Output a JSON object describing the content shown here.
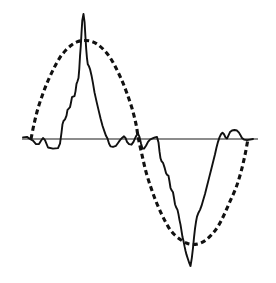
{
  "figure": {
    "background_color": "#ffffff",
    "width": 276,
    "height": 283
  },
  "chart_data": {
    "type": "line",
    "title": "",
    "subtitle": "",
    "xlabel": "",
    "ylabel": "",
    "grid": false,
    "legend_position": "none",
    "axis_visible": true,
    "xlim": [
      0,
      276
    ],
    "ylim": [
      -1.45,
      1.25
    ],
    "zero_axis": {
      "label": "zero-line",
      "y_value": 0,
      "x_start": 22,
      "x_end": 258,
      "y_pixel": 139,
      "color": "#1a1a1a",
      "width": 1.2
    },
    "series": [
      {
        "name": "reference-sine",
        "style": "dashed",
        "color": "#111111",
        "stroke_width": 3.1,
        "dash_pattern": "5,3.4",
        "description": "dashed sinusoidal reference, one full cycle",
        "cycle": {
          "zero_crossings_px": [
            31,
            138.5,
            248
          ],
          "positive_peak_px": {
            "x": 85,
            "y": 85
          },
          "negative_peak_px": {
            "x": 193,
            "y": 196
          },
          "amplitude_value": 0.93,
          "period_px": 217
        },
        "points": [
          [
            31,
            0.0
          ],
          [
            34,
            0.14
          ],
          [
            38,
            0.29
          ],
          [
            43,
            0.43
          ],
          [
            48,
            0.55
          ],
          [
            54,
            0.67
          ],
          [
            60,
            0.77
          ],
          [
            66,
            0.84
          ],
          [
            72,
            0.89
          ],
          [
            78,
            0.92
          ],
          [
            85,
            0.93
          ],
          [
            92,
            0.92
          ],
          [
            98,
            0.89
          ],
          [
            104,
            0.84
          ],
          [
            110,
            0.77
          ],
          [
            116,
            0.67
          ],
          [
            122,
            0.55
          ],
          [
            127,
            0.43
          ],
          [
            132,
            0.29
          ],
          [
            136,
            0.14
          ],
          [
            138.5,
            0.0
          ],
          [
            142,
            -0.14
          ],
          [
            146,
            -0.29
          ],
          [
            151,
            -0.43
          ],
          [
            156,
            -0.55
          ],
          [
            162,
            -0.67
          ],
          [
            168,
            -0.77
          ],
          [
            174,
            -0.84
          ],
          [
            181,
            -0.89
          ],
          [
            187,
            -0.92
          ],
          [
            193,
            -0.93
          ],
          [
            200,
            -0.92
          ],
          [
            206,
            -0.89
          ],
          [
            212,
            -0.84
          ],
          [
            218,
            -0.77
          ],
          [
            224,
            -0.67
          ],
          [
            230,
            -0.55
          ],
          [
            236,
            -0.43
          ],
          [
            241,
            -0.29
          ],
          [
            245,
            -0.14
          ],
          [
            248,
            0.0
          ]
        ]
      },
      {
        "name": "measured-signal",
        "style": "solid",
        "color": "#111111",
        "stroke_width": 1.9,
        "description": "solid measured trace with narrow spike at each half-cycle and stepped flanks",
        "features": {
          "positive_spike_px": {
            "x": 83.5,
            "y": 14
          },
          "positive_spike_value": 1.18,
          "negative_spike_px": {
            "x": 190.5,
            "y": 266
          },
          "negative_spike_value": -1.12,
          "small_bumps": [
            "left-shoulder",
            "mid-notch",
            "right-double-bump"
          ]
        },
        "points": [
          [
            23,
            0.015
          ],
          [
            27,
            0.02
          ],
          [
            30,
            0.0
          ],
          [
            33,
            -0.015
          ],
          [
            36,
            -0.045
          ],
          [
            39,
            -0.045
          ],
          [
            41,
            -0.015
          ],
          [
            43,
            0.01
          ],
          [
            45,
            -0.01
          ],
          [
            48,
            -0.075
          ],
          [
            53,
            -0.085
          ],
          [
            58,
            -0.08
          ],
          [
            60,
            -0.04
          ],
          [
            61.5,
            0.06
          ],
          [
            62.5,
            0.14
          ],
          [
            63.5,
            0.17
          ],
          [
            65,
            0.185
          ],
          [
            66.5,
            0.22
          ],
          [
            67.5,
            0.275
          ],
          [
            68.5,
            0.285
          ],
          [
            70,
            0.3
          ],
          [
            71,
            0.345
          ],
          [
            72,
            0.395
          ],
          [
            73,
            0.4
          ],
          [
            74.5,
            0.405
          ],
          [
            75.5,
            0.45
          ],
          [
            76.5,
            0.52
          ],
          [
            77.5,
            0.545
          ],
          [
            78.5,
            0.575
          ],
          [
            79.3,
            0.665
          ],
          [
            80,
            0.78
          ],
          [
            80.8,
            0.88
          ],
          [
            81.5,
            1.0
          ],
          [
            82.3,
            1.12
          ],
          [
            83.5,
            1.18
          ],
          [
            84.6,
            1.1
          ],
          [
            85.4,
            0.97
          ],
          [
            86.2,
            0.85
          ],
          [
            87,
            0.76
          ],
          [
            87.8,
            0.705
          ],
          [
            88.8,
            0.69
          ],
          [
            90,
            0.66
          ],
          [
            91.5,
            0.6
          ],
          [
            93,
            0.525
          ],
          [
            94.5,
            0.44
          ],
          [
            96.5,
            0.355
          ],
          [
            98.5,
            0.275
          ],
          [
            100.5,
            0.195
          ],
          [
            102.5,
            0.125
          ],
          [
            104.5,
            0.07
          ],
          [
            106,
            0.03
          ],
          [
            107.5,
            0.005
          ],
          [
            109,
            -0.04
          ],
          [
            110.5,
            -0.065
          ],
          [
            113,
            -0.07
          ],
          [
            116,
            -0.06
          ],
          [
            118,
            -0.035
          ],
          [
            120,
            -0.01
          ],
          [
            122,
            0.01
          ],
          [
            124,
            0.025
          ],
          [
            125.5,
            0.01
          ],
          [
            127,
            -0.025
          ],
          [
            129,
            -0.045
          ],
          [
            131.5,
            -0.05
          ],
          [
            133.5,
            -0.025
          ],
          [
            135,
            0.005
          ],
          [
            136.5,
            0.035
          ],
          [
            138,
            0.05
          ],
          [
            139.5,
            0.02
          ],
          [
            141,
            -0.04
          ],
          [
            142.5,
            -0.085
          ],
          [
            144,
            -0.085
          ],
          [
            146,
            -0.06
          ],
          [
            148,
            -0.025
          ],
          [
            150,
            -0.005
          ],
          [
            152.5,
            0.005
          ],
          [
            155,
            0.015
          ],
          [
            157,
            0.02
          ],
          [
            158.5,
            -0.03
          ],
          [
            159.5,
            -0.11
          ],
          [
            160.5,
            -0.17
          ],
          [
            161.5,
            -0.195
          ],
          [
            163,
            -0.21
          ],
          [
            164.5,
            -0.25
          ],
          [
            166,
            -0.3
          ],
          [
            167,
            -0.315
          ],
          [
            168.5,
            -0.325
          ],
          [
            169.5,
            -0.375
          ],
          [
            170.5,
            -0.43
          ],
          [
            171.5,
            -0.45
          ],
          [
            173,
            -0.47
          ],
          [
            174,
            -0.52
          ],
          [
            175,
            -0.575
          ],
          [
            176,
            -0.6
          ],
          [
            177.5,
            -0.625
          ],
          [
            178.5,
            -0.665
          ],
          [
            179.5,
            -0.715
          ],
          [
            180.5,
            -0.755
          ],
          [
            181.5,
            -0.81
          ],
          [
            182.5,
            -0.865
          ],
          [
            183.5,
            -0.9
          ],
          [
            184.5,
            -0.945
          ],
          [
            185.5,
            -0.985
          ],
          [
            186.5,
            -1.02
          ],
          [
            188,
            -1.06
          ],
          [
            189.5,
            -1.1
          ],
          [
            190.5,
            -1.12
          ],
          [
            191.8,
            -1.05
          ],
          [
            193,
            -0.96
          ],
          [
            194,
            -0.87
          ],
          [
            195,
            -0.79
          ],
          [
            196,
            -0.73
          ],
          [
            197,
            -0.685
          ],
          [
            198.5,
            -0.65
          ],
          [
            200,
            -0.625
          ],
          [
            201.5,
            -0.59
          ],
          [
            203,
            -0.545
          ],
          [
            205,
            -0.485
          ],
          [
            207,
            -0.415
          ],
          [
            209,
            -0.345
          ],
          [
            211,
            -0.275
          ],
          [
            213,
            -0.205
          ],
          [
            215,
            -0.135
          ],
          [
            216.5,
            -0.075
          ],
          [
            218,
            -0.025
          ],
          [
            219.5,
            0.015
          ],
          [
            221,
            0.045
          ],
          [
            222.5,
            0.06
          ],
          [
            224,
            0.045
          ],
          [
            225.5,
            0.015
          ],
          [
            227,
            0.005
          ],
          [
            228.5,
            0.035
          ],
          [
            230,
            0.065
          ],
          [
            232,
            0.08
          ],
          [
            234.5,
            0.085
          ],
          [
            237,
            0.08
          ],
          [
            239,
            0.06
          ],
          [
            240.5,
            0.035
          ],
          [
            242,
            0.01
          ],
          [
            244,
            -0.005
          ],
          [
            247,
            -0.01
          ],
          [
            250,
            -0.005
          ],
          [
            253,
            0.0
          ]
        ]
      }
    ]
  }
}
